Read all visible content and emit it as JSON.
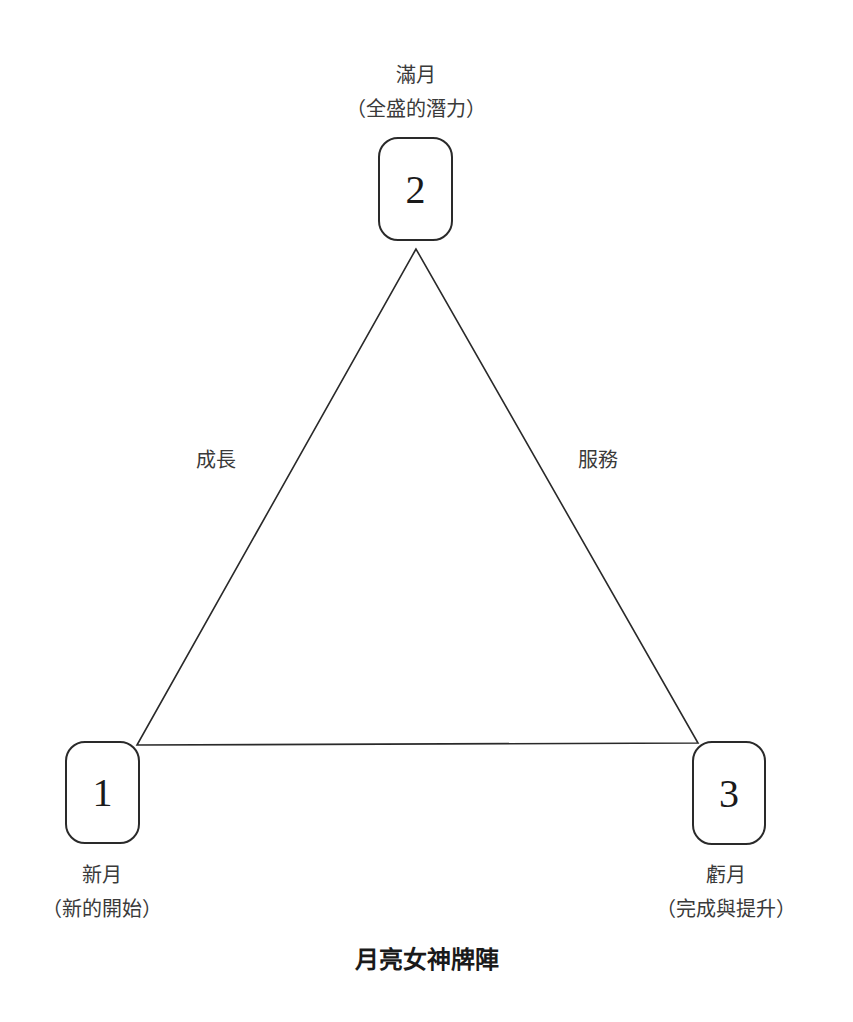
{
  "title": "月亮女神牌陣",
  "positions": [
    {
      "number": "1",
      "name": "新月",
      "meaning": "（新的開始）"
    },
    {
      "number": "2",
      "name": "滿月",
      "meaning": "（全盛的潛力）"
    },
    {
      "number": "3",
      "name": "虧月",
      "meaning": "（完成與提升）"
    }
  ],
  "edges": {
    "left": "成長",
    "right": "服務"
  },
  "colors": {
    "line": "#2a2a2a",
    "text": "#3a3a3a",
    "background": "#ffffff"
  }
}
